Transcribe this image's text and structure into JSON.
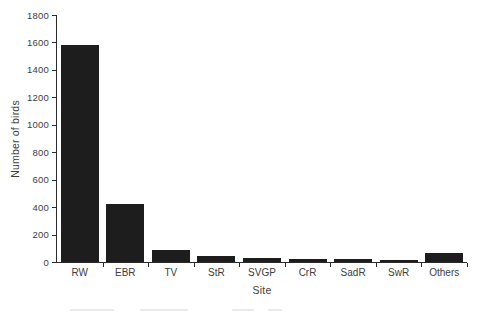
{
  "figure": {
    "background": "#ffffff",
    "bar_color": "#1d1d1d",
    "axis_color": "#2b2b2b",
    "text_color": "#3d3d3d"
  },
  "chart_data": {
    "type": "bar",
    "title": "",
    "xlabel": "Site",
    "ylabel": "Number of birds",
    "categories": [
      "RW",
      "EBR",
      "TV",
      "StR",
      "SVGP",
      "CrR",
      "SadR",
      "SwR",
      "Others"
    ],
    "values": [
      1580,
      420,
      90,
      45,
      30,
      20,
      20,
      18,
      65
    ],
    "ylim": [
      0,
      1800
    ],
    "ytick_step": 200,
    "yticks": [
      0,
      200,
      400,
      600,
      800,
      1000,
      1200,
      1400,
      1600,
      1800
    ],
    "grid": false,
    "legend": "none"
  }
}
